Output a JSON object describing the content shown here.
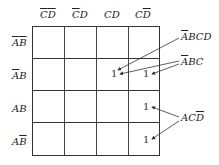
{
  "kmap": {
    "columns": [
      {
        "parts": [
          {
            "t": "C",
            "bar": true
          },
          {
            "t": "D",
            "bar": true
          }
        ]
      },
      {
        "parts": [
          {
            "t": "C",
            "bar": true
          },
          {
            "t": "D",
            "bar": false
          }
        ]
      },
      {
        "parts": [
          {
            "t": "C",
            "bar": false
          },
          {
            "t": "D",
            "bar": false
          }
        ]
      },
      {
        "parts": [
          {
            "t": "C",
            "bar": false
          },
          {
            "t": "D",
            "bar": true
          }
        ]
      }
    ],
    "rows": [
      {
        "parts": [
          {
            "t": "A",
            "bar": true
          },
          {
            "t": "B",
            "bar": true
          }
        ]
      },
      {
        "parts": [
          {
            "t": "A",
            "bar": true
          },
          {
            "t": "B",
            "bar": false
          }
        ]
      },
      {
        "parts": [
          {
            "t": "A",
            "bar": false
          },
          {
            "t": "B",
            "bar": false
          }
        ]
      },
      {
        "parts": [
          {
            "t": "A",
            "bar": false
          },
          {
            "t": "B",
            "bar": true
          }
        ]
      }
    ],
    "cells": [
      [
        "",
        "",
        "",
        ""
      ],
      [
        "",
        "",
        "1",
        "1"
      ],
      [
        "",
        "",
        "",
        "1"
      ],
      [
        "",
        "",
        "",
        "1"
      ]
    ],
    "annotations": [
      {
        "parts": [
          {
            "t": "A",
            "bar": true
          },
          {
            "t": "BCD",
            "bar": false
          }
        ]
      },
      {
        "parts": [
          {
            "t": "A",
            "bar": true
          },
          {
            "t": "BC",
            "bar": false
          }
        ]
      },
      {
        "parts": [
          {
            "t": "AC",
            "bar": false
          },
          {
            "t": "D",
            "bar": true
          }
        ]
      }
    ]
  }
}
